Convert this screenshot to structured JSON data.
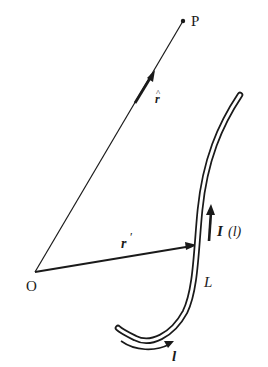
{
  "diagram": {
    "labels": {
      "point_P": "P",
      "origin_O": "O",
      "unit_vector_r": "r",
      "unit_vector_hat": "^",
      "position_r_prime": "r",
      "prime_mark": "′",
      "current": "I",
      "current_arg": "(l)",
      "curve_L": "L",
      "path_l": "l"
    },
    "colors": {
      "ink": "#1a1a1a",
      "background": "#ffffff"
    }
  }
}
